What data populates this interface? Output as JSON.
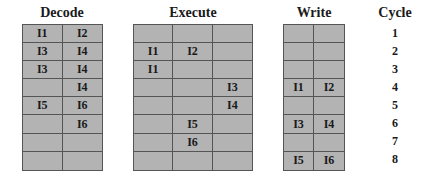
{
  "stages": [
    {
      "name": "Decode",
      "columns": 2,
      "rows": [
        [
          "I1",
          "I2"
        ],
        [
          "I3",
          "I4"
        ],
        [
          "I3",
          "I4"
        ],
        [
          "",
          "I4"
        ],
        [
          "I5",
          "I6"
        ],
        [
          "",
          "I6"
        ],
        [
          "",
          ""
        ],
        [
          "",
          ""
        ]
      ]
    },
    {
      "name": "Execute",
      "columns": 3,
      "rows": [
        [
          "",
          "",
          ""
        ],
        [
          "I1",
          "I2",
          ""
        ],
        [
          "I1",
          "",
          ""
        ],
        [
          "",
          "",
          "I3"
        ],
        [
          "",
          "",
          "I4"
        ],
        [
          "",
          "I5",
          ""
        ],
        [
          "",
          "I6",
          ""
        ],
        [
          "",
          "",
          ""
        ]
      ]
    },
    {
      "name": "Write",
      "columns": 2,
      "rows": [
        [
          "",
          ""
        ],
        [
          "",
          ""
        ],
        [
          "",
          ""
        ],
        [
          "I1",
          "I2"
        ],
        [
          "",
          ""
        ],
        [
          "I3",
          "I4"
        ],
        [
          "",
          ""
        ],
        [
          "I5",
          "I6"
        ]
      ]
    }
  ],
  "cycle": {
    "label": "Cycle",
    "values": [
      "1",
      "2",
      "3",
      "4",
      "5",
      "6",
      "7",
      "8"
    ]
  },
  "colors": {
    "cell_fill": "#b3b3b3",
    "grid_line": "#555555",
    "text": "#1a1a1a"
  }
}
